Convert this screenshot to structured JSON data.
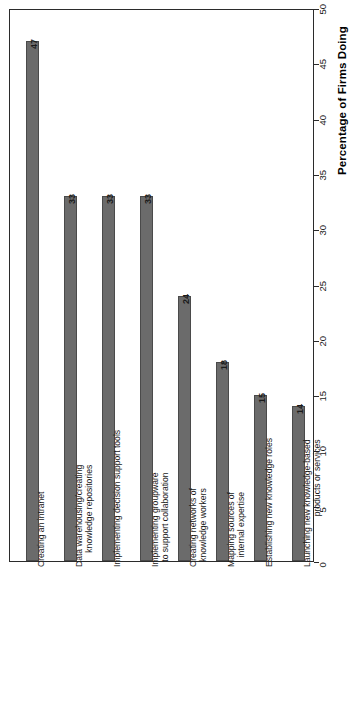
{
  "chart_data": {
    "type": "bar",
    "title": "",
    "subtitle": "",
    "orientation": "rotated-90-vertical-bars",
    "xlabel": "",
    "ylabel": "Percentage of Firms Doing",
    "ylim": [
      0,
      50
    ],
    "ytick_step": 5,
    "yticks": [
      0,
      5,
      10,
      15,
      20,
      25,
      30,
      35,
      40,
      45,
      50
    ],
    "ytick_labels": [
      "0",
      "5",
      "10",
      "15",
      "20",
      "25",
      "30",
      "35",
      "40",
      "45",
      "50"
    ],
    "grid": false,
    "legend": false,
    "legend_position": "none",
    "bar_color": "#6b6b6b",
    "bar_edge_color": "#4a4a4a",
    "axis_color": "#2b2b2b",
    "show_value_labels": true,
    "categories": [
      "Creating an intranet",
      "Data warehousing/creating knowledge repositories",
      "Implementing decision support tools",
      "Implementing groupware to support collaboration",
      "Creating networks of knowledge workers",
      "Mapping sources of internal expertise",
      "Establishing new knowledge roles",
      "Launching new knowledge-based products or services"
    ],
    "category_lines": [
      [
        "Creating an intranet"
      ],
      [
        "Data warehousing/creating",
        "knowledge repositories"
      ],
      [
        "Implementing decision support tools"
      ],
      [
        "Implementing groupware",
        "to support collaboration"
      ],
      [
        "Creating networks of",
        "knowledge workers"
      ],
      [
        "Mapping sources of",
        "internal expertise"
      ],
      [
        "Establishing new knowledge roles"
      ],
      [
        "Launching new knowledge-based",
        "products or services"
      ]
    ],
    "values": [
      47,
      33,
      33,
      33,
      24,
      18,
      15,
      14
    ],
    "value_labels": [
      "47",
      "33",
      "33",
      "33",
      "24",
      "18",
      "15",
      "14"
    ]
  }
}
